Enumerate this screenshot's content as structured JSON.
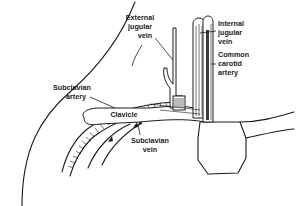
{
  "figure": {
    "type": "anatomical line illustration",
    "line_color": "#1a1a1a",
    "background": "#ffffff"
  },
  "labels": {
    "external_jugular_vein": {
      "lines": [
        "External",
        "jugular",
        "vein"
      ]
    },
    "internal_jugular_vein": {
      "lines": [
        "Internal",
        "jugular",
        "vein"
      ]
    },
    "common_carotid_artery": {
      "lines": [
        "Common",
        "carotid",
        "artery"
      ]
    },
    "subclavian_artery": {
      "lines": [
        "Subclavian",
        "artery"
      ]
    },
    "clavicle": {
      "lines": [
        "Clavicle"
      ]
    },
    "subclavian_vein": {
      "lines": [
        "Subclavian",
        "vein"
      ]
    }
  }
}
